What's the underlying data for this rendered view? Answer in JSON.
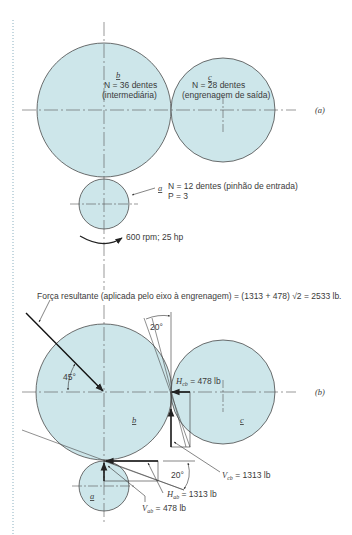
{
  "colors": {
    "gear_fill": "#cde6ea",
    "outline": "#4a4a4a",
    "text": "#3a3a3a",
    "margin_rule": "#8ab0c0"
  },
  "part_a": {
    "tag": "(a)",
    "gear_b": {
      "letter": "b",
      "teeth_line": "N = 36 dentes",
      "role": "(intermediária)"
    },
    "gear_c": {
      "letter": "c",
      "teeth_line": "N = 28 dentes",
      "role": "(engrenagem de saída)"
    },
    "gear_a": {
      "letter": "a",
      "teeth_line": "N = 12 dentes (pinhão de entrada)",
      "pitch_line": "P = 3"
    },
    "input": "600 rpm; 25 hp"
  },
  "part_b": {
    "tag": "(b)",
    "resultant": "Força resultante (aplicada pelo eixo à engrenagem) = (1313 + 478)  √2 = 2533 lb.",
    "angle_45": "45°",
    "angle_20_top": "20°",
    "angle_20_bottom": "20°",
    "gear_b_letter": "b",
    "gear_c_letter": "c",
    "gear_a_letter": "a",
    "forces": {
      "H_cb": "H",
      "H_cb_sub": "cb",
      "H_cb_value": " = 478 lb",
      "V_cb": "V",
      "V_cb_sub": "cb",
      "V_cb_value": " = 1313 lb",
      "H_ab": "H",
      "H_ab_sub": "ab",
      "H_ab_value": " = 1313 lb",
      "V_ab": "V",
      "V_ab_sub": "ab",
      "V_ab_value": " = 478 lb"
    }
  }
}
